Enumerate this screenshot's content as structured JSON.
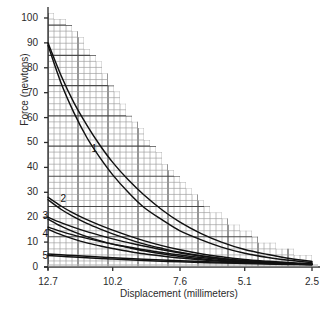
{
  "chart_data": {
    "type": "line",
    "title": "",
    "subtitle": "",
    "xlabel": "Displacement (millimeters)",
    "ylabel": "Force (newtons)",
    "xticks": [
      "12.7",
      "10.2",
      "7.6",
      "5.1",
      "2.5"
    ],
    "xtick_values": [
      12.7,
      10.2,
      7.6,
      5.1,
      2.5
    ],
    "yticks": [
      "0",
      "10",
      "20",
      "30",
      "40",
      "50",
      "60",
      "70",
      "80",
      "90",
      "100"
    ],
    "ytick_values": [
      0,
      10,
      20,
      30,
      40,
      50,
      60,
      70,
      80,
      90,
      100
    ],
    "xlim": [
      12.7,
      2.5
    ],
    "ylim": [
      0,
      100
    ],
    "x_axis_direction": "decreasing",
    "grid": true,
    "grid_minor": true,
    "grid_clipped_to_envelope": true,
    "legend": "inline-curve-numbers",
    "legend_position": "inline",
    "annotations": [
      {
        "label": "1",
        "x": 10.9,
        "y": 47
      },
      {
        "label": "2",
        "x": 12.1,
        "y": 27
      },
      {
        "label": "3",
        "x": 12.8,
        "y": 20
      },
      {
        "label": "4",
        "x": 12.8,
        "y": 13
      },
      {
        "label": "5",
        "x": 12.8,
        "y": 4
      }
    ],
    "series": [
      {
        "name": "1",
        "x": [
          12.7,
          12.2,
          11.7,
          11.2,
          10.7,
          10.2,
          9.6,
          9.0,
          8.3,
          7.6,
          6.8,
          6.0,
          5.1,
          4.2,
          3.3,
          2.5
        ],
        "values": [
          90,
          77,
          66,
          57,
          49,
          42,
          35,
          29,
          23,
          18,
          13.5,
          10,
          7,
          5,
          3.3,
          2.2
        ]
      },
      {
        "name": "1b",
        "x": [
          12.7,
          12.2,
          11.7,
          11.2,
          10.7,
          10.2,
          9.6,
          9.0,
          8.3,
          7.6,
          6.8,
          6.0,
          5.1,
          4.2,
          3.3,
          2.5
        ],
        "values": [
          89,
          74,
          62,
          52,
          44,
          37,
          30,
          24,
          19,
          14.5,
          11,
          8,
          5.5,
          3.8,
          2.6,
          1.8
        ]
      },
      {
        "name": "2",
        "x": [
          12.7,
          12.2,
          11.7,
          11.2,
          10.7,
          10.2,
          9.6,
          9.0,
          8.3,
          7.6,
          6.8,
          6.0,
          5.1,
          4.2,
          3.3,
          2.5
        ],
        "values": [
          28,
          24.5,
          21.5,
          19,
          16.8,
          14.8,
          12.6,
          10.6,
          8.6,
          6.9,
          5.3,
          4.1,
          3.0,
          2.3,
          1.7,
          1.3
        ]
      },
      {
        "name": "2b",
        "x": [
          12.7,
          12.2,
          11.7,
          11.2,
          10.7,
          10.2,
          9.6,
          9.0,
          8.3,
          7.6,
          6.8,
          6.0,
          5.1,
          4.2,
          3.3,
          2.5
        ],
        "values": [
          27,
          23.2,
          20.1,
          17.5,
          15.3,
          13.3,
          11.2,
          9.3,
          7.5,
          5.9,
          4.5,
          3.4,
          2.5,
          1.9,
          1.4,
          1.1
        ]
      },
      {
        "name": "3",
        "x": [
          12.7,
          12.2,
          11.7,
          11.2,
          10.7,
          10.2,
          9.6,
          9.0,
          8.3,
          7.6,
          6.8,
          6.0,
          5.1,
          4.2,
          3.3,
          2.5
        ],
        "values": [
          20,
          17.8,
          15.9,
          14.2,
          12.7,
          11.3,
          9.8,
          8.4,
          6.9,
          5.6,
          4.4,
          3.4,
          2.5,
          1.9,
          1.5,
          1.2
        ]
      },
      {
        "name": "3b",
        "x": [
          12.7,
          12.2,
          11.7,
          11.2,
          10.7,
          10.2,
          9.6,
          9.0,
          8.3,
          7.6,
          6.8,
          6.0,
          5.1,
          4.2,
          3.3,
          2.5
        ],
        "values": [
          19.2,
          16.4,
          14.1,
          12.2,
          10.6,
          9.2,
          7.8,
          6.5,
          5.3,
          4.2,
          3.3,
          2.6,
          2.0,
          1.6,
          1.3,
          1.0
        ]
      },
      {
        "name": "4",
        "x": [
          12.7,
          12.2,
          11.7,
          11.2,
          10.7,
          10.2,
          9.6,
          9.0,
          8.3,
          7.6,
          6.8,
          6.0,
          5.1,
          4.2,
          3.3,
          2.5
        ],
        "values": [
          16,
          14.3,
          12.8,
          11.5,
          10.3,
          9.2,
          8.0,
          6.9,
          5.8,
          4.8,
          3.8,
          3.0,
          2.3,
          1.8,
          1.4,
          1.1
        ]
      },
      {
        "name": "4b",
        "x": [
          12.7,
          12.2,
          11.7,
          11.2,
          10.7,
          10.2,
          9.6,
          9.0,
          8.3,
          7.6,
          6.8,
          6.0,
          5.1,
          4.2,
          3.3,
          2.5
        ],
        "values": [
          15.2,
          13.0,
          11.2,
          9.7,
          8.5,
          7.4,
          6.3,
          5.3,
          4.4,
          3.6,
          2.9,
          2.3,
          1.8,
          1.4,
          1.2,
          1.0
        ]
      },
      {
        "name": "5",
        "x": [
          12.7,
          12.2,
          11.7,
          11.2,
          10.7,
          10.2,
          9.6,
          9.0,
          8.3,
          7.6,
          6.8,
          6.0,
          5.1,
          4.2,
          3.3,
          2.5
        ],
        "values": [
          5.2,
          4.9,
          4.6,
          4.3,
          4.0,
          3.7,
          3.4,
          3.1,
          2.8,
          2.5,
          2.2,
          1.9,
          1.6,
          1.4,
          1.2,
          1.0
        ]
      },
      {
        "name": "5b",
        "x": [
          12.7,
          12.2,
          11.7,
          11.2,
          10.7,
          10.2,
          9.6,
          9.0,
          8.3,
          7.6,
          6.8,
          6.0,
          5.1,
          4.2,
          3.3,
          2.5
        ],
        "values": [
          4.6,
          4.3,
          4.0,
          3.7,
          3.4,
          3.2,
          2.9,
          2.6,
          2.3,
          2.1,
          1.8,
          1.6,
          1.4,
          1.2,
          1.0,
          0.9
        ]
      }
    ],
    "envelope": {
      "description": "grid region upper boundary (stepped decaying curve)",
      "x": [
        12.7,
        12.2,
        11.7,
        11.2,
        10.7,
        10.2,
        9.6,
        9.0,
        8.3,
        7.6,
        6.8,
        6.0,
        5.1,
        4.2,
        3.3,
        2.5
      ],
      "values": [
        102,
        100,
        96,
        90,
        83,
        74,
        64,
        55,
        45,
        36,
        28,
        21,
        15,
        10,
        6.5,
        4
      ]
    },
    "colors": {
      "curve": "#111111",
      "grid_minor": "#9a9a9a",
      "grid_major": "#4a4a4a",
      "axis": "#2b2b2b",
      "background": "#ffffff",
      "baseline_shadow": "#b5b5b5"
    }
  }
}
